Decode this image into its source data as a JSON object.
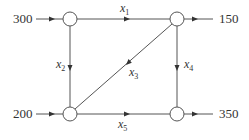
{
  "diagram": {
    "type": "network-flow",
    "colors": {
      "line": "#555555",
      "text": "#333333",
      "background": "#ffffff"
    },
    "nodes": [
      {
        "id": "top-left",
        "x": 70,
        "y": 19
      },
      {
        "id": "top-right",
        "x": 177,
        "y": 19
      },
      {
        "id": "bottom-left",
        "x": 70,
        "y": 114
      },
      {
        "id": "bottom-right",
        "x": 177,
        "y": 114
      }
    ],
    "external_flows": {
      "in_top_left": {
        "value": "300",
        "direction": "in"
      },
      "out_top_right": {
        "value": "150",
        "direction": "out"
      },
      "in_bottom_left": {
        "value": "200",
        "direction": "in"
      },
      "out_bottom_right": {
        "value": "350",
        "direction": "out"
      }
    },
    "edges": {
      "x1": {
        "var": "x",
        "sub": "1",
        "from": "top-left",
        "to": "top-right"
      },
      "x2": {
        "var": "x",
        "sub": "2",
        "from": "top-left",
        "to": "bottom-left"
      },
      "x3": {
        "var": "x",
        "sub": "3",
        "from": "top-right",
        "to": "bottom-left"
      },
      "x4": {
        "var": "x",
        "sub": "4",
        "from": "top-right",
        "to": "bottom-right"
      },
      "x5": {
        "var": "x",
        "sub": "5",
        "from": "bottom-left",
        "to": "bottom-right"
      }
    }
  }
}
